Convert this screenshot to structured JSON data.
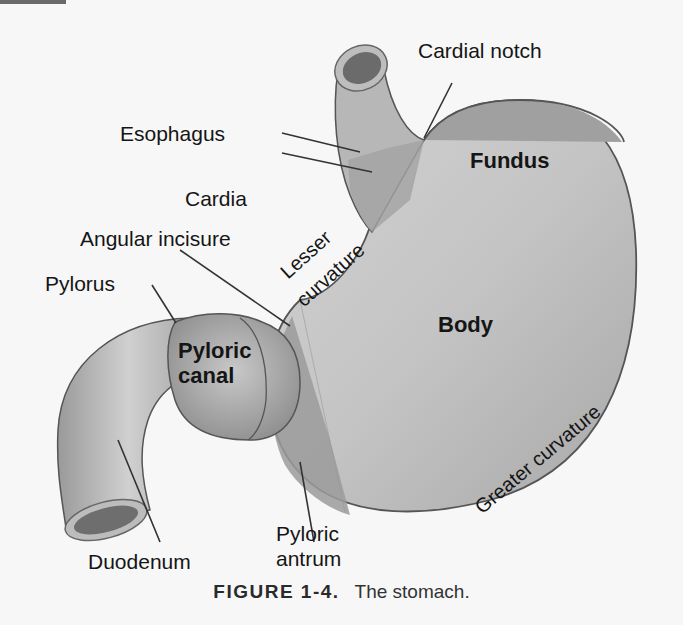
{
  "figure": {
    "number_label": "FIGURE 1-4.",
    "caption_text": "The stomach."
  },
  "labels": {
    "cardial_notch": "Cardial notch",
    "esophagus": "Esophagus",
    "fundus": "Fundus",
    "cardia": "Cardia",
    "angular_incisure": "Angular incisure",
    "lesser_curvature_1": "Lesser",
    "lesser_curvature_2": "curvature",
    "pylorus": "Pylorus",
    "body": "Body",
    "pyloric_canal_1": "Pyloric",
    "pyloric_canal_2": "canal",
    "greater_curvature": "Greater curvature",
    "duodenum": "Duodenum",
    "pyloric_antrum_1": "Pyloric",
    "pyloric_antrum_2": "antrum"
  },
  "colors": {
    "background": "#f7f7f7",
    "organ_light": "#c9c9c9",
    "organ_mid": "#a9a9a9",
    "organ_dark": "#8c8c8c",
    "outline": "#555555",
    "leader_line": "#333333"
  }
}
